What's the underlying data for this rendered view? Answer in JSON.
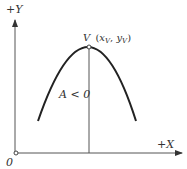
{
  "diagram": {
    "y_axis_label": "+Y",
    "x_axis_label": "+X",
    "origin_label": "0",
    "vertex_label": "V (x_V , y_V)",
    "vertex_label_parts": {
      "v": "V",
      "open": "(",
      "x": "x",
      "xsub": "V",
      "comma": ",",
      "y": "y",
      "ysub": "V",
      "close": ")"
    },
    "condition_label": "A < 0"
  },
  "colors": {
    "stroke": "#222222",
    "axis": "#555555",
    "text": "#333333"
  }
}
